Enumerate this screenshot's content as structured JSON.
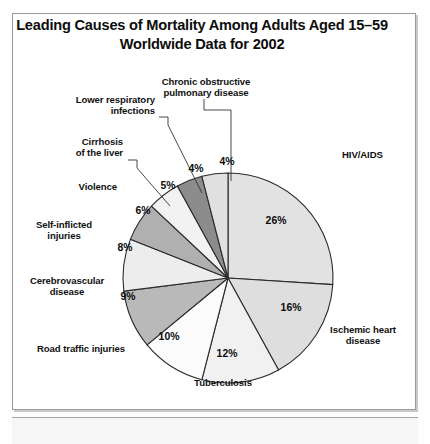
{
  "title": {
    "line1": "Leading Causes of Mortality Among Adults Aged 15–59",
    "line2": "Worldwide Data for 2002"
  },
  "chart_data": {
    "type": "pie",
    "title": "Leading Causes of Mortality Among Adults Aged 15–59 Worldwide Data for 2002",
    "subtitle": "Worldwide Data for 2002",
    "xlabel": "",
    "ylabel": "",
    "grid": false,
    "legend_position": "callout-labels",
    "units": "percent of deaths",
    "start_angle_deg": 0,
    "direction": "clockwise",
    "categories": [
      "HIV/AIDS",
      "Ischemic heart disease",
      "Tuberculosis",
      "Road traffic injuries",
      "Cerebrovascular disease",
      "Self-inflicted injuries",
      "Violence",
      "Cirrhosis of the liver",
      "Lower respiratory infections",
      "Chronic obstructive pulmonary disease"
    ],
    "values": [
      26,
      16,
      12,
      10,
      9,
      8,
      6,
      5,
      4,
      4
    ],
    "labels": [
      "26%",
      "16%",
      "12%",
      "10%",
      "9%",
      "8%",
      "6%",
      "5%",
      "4%",
      "4%"
    ],
    "slices": [
      {
        "name": "HIV/AIDS",
        "value": 26,
        "label": "26%",
        "color": "#e2e2e2"
      },
      {
        "name": "Ischemic heart disease",
        "value": 16,
        "label": "16%",
        "color": "#dedede"
      },
      {
        "name": "Tuberculosis",
        "value": 12,
        "label": "12%",
        "color": "#f1f1f1"
      },
      {
        "name": "Road traffic injuries",
        "value": 10,
        "label": "10%",
        "color": "#fbfbfb"
      },
      {
        "name": "Cerebrovascular disease",
        "value": 9,
        "label": "9%",
        "color": "#b9b9b9"
      },
      {
        "name": "Self-inflicted injuries",
        "value": 8,
        "label": "8%",
        "color": "#ededed"
      },
      {
        "name": "Violence",
        "value": 6,
        "label": "6%",
        "color": "#b0b0b0"
      },
      {
        "name": "Cirrhosis of the liver",
        "value": 5,
        "label": "5%",
        "color": "#f2f2f2"
      },
      {
        "name": "Lower respiratory infections",
        "value": 4,
        "label": "4%",
        "color": "#8c8c8c"
      },
      {
        "name": "Chronic obstructive pulmonary disease",
        "value": 4,
        "label": "4%",
        "color": "#e0e0e0"
      }
    ]
  },
  "callouts": {
    "copd": {
      "l1": "Chronic obstructive",
      "l2": "pulmonary disease"
    },
    "lri": {
      "l1": "Lower respiratory",
      "l2": "infections"
    },
    "cirrhosis": {
      "l1": "Cirrhosis",
      "l2": "of the liver"
    },
    "violence": {
      "l1": "Violence"
    },
    "selfinflicted": {
      "l1": "Self-inflicted",
      "l2": "injuries"
    },
    "cerebrovascular": {
      "l1": "Cerebrovascular",
      "l2": "disease"
    },
    "road": {
      "l1": "Road traffic injuries"
    },
    "tuberculosis": {
      "l1": "Tuberculosis"
    },
    "hiv": {
      "l1": "HIV/AIDS"
    },
    "ischemic": {
      "l1": "Ischemic heart",
      "l2": "disease"
    }
  },
  "pct": {
    "p26": "26%",
    "p16": "16%",
    "p12": "12%",
    "p10": "10%",
    "p9": "9%",
    "p8": "8%",
    "p6": "6%",
    "p5": "5%",
    "p4a": "4%",
    "p4b": "4%"
  },
  "colors": {
    "frame_border": "#9a9a9a",
    "slice_outline": "#2b2b2b",
    "text": "#111111",
    "background": "#ffffff"
  }
}
